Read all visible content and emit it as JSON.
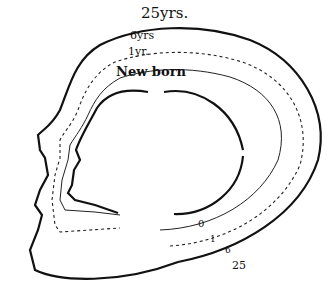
{
  "diagram": {
    "curve_labels_top": [
      {
        "id": "adult",
        "text": "25yrs."
      },
      {
        "id": "child",
        "text": "6yrs"
      },
      {
        "id": "infant",
        "text": "1yr."
      },
      {
        "id": "newborn",
        "text": "New born"
      }
    ],
    "curve_labels_bottom": [
      {
        "id": "newborn",
        "text": "0"
      },
      {
        "id": "infant",
        "text": "1"
      },
      {
        "id": "child",
        "text": "6"
      },
      {
        "id": "adult",
        "text": "25"
      }
    ],
    "line_styles": {
      "newborn": "solid-thick",
      "infant": "solid-thin",
      "child": "dashed",
      "adult": "solid-thick"
    },
    "colors": {
      "ink": "#111111",
      "background": "#ffffff"
    }
  }
}
